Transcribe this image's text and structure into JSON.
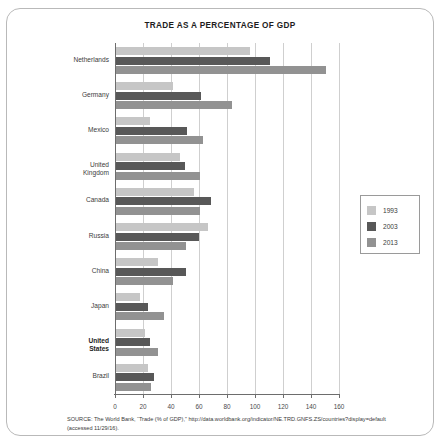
{
  "figure": {
    "title": "TRADE AS A PERCENTAGE OF GDP",
    "source_note": "SOURCE: The World Bank, “Trade (% of GDP),” http://data.worldbank.org/indicator/NE.TRD.GNFS.ZS/countries?display=default (accessed 11/29/16)."
  },
  "legend": {
    "position": "right",
    "items": [
      {
        "label": "1993",
        "color": "#c6c6c6"
      },
      {
        "label": "2003",
        "color": "#585858"
      },
      {
        "label": "2013",
        "color": "#929292"
      }
    ]
  },
  "axis": {
    "x_ticks": [
      "0",
      "20",
      "40",
      "60",
      "80",
      "100",
      "120",
      "140",
      "160"
    ]
  },
  "chart_data": {
    "type": "bar",
    "orientation": "horizontal",
    "title": "TRADE AS A PERCENTAGE OF GDP",
    "xlabel": "",
    "ylabel": "",
    "xlim": [
      0,
      160
    ],
    "xticks": [
      0,
      20,
      40,
      60,
      80,
      100,
      120,
      140,
      160
    ],
    "grid": true,
    "legend_position": "right",
    "categories": [
      "Netherlands",
      "Germany",
      "Mexico",
      "United Kingdom",
      "Canada",
      "Russia",
      "China",
      "Japan",
      "United States",
      "Brazil"
    ],
    "series": [
      {
        "name": "1993",
        "color": "#c6c6c6",
        "values": [
          96,
          41,
          24,
          46,
          56,
          66,
          30,
          17,
          21,
          23
        ]
      },
      {
        "name": "2003",
        "color": "#585858",
        "values": [
          110,
          61,
          51,
          49,
          68,
          59,
          50,
          23,
          24,
          27
        ]
      },
      {
        "name": "2013",
        "color": "#929292",
        "values": [
          150,
          83,
          62,
          60,
          60,
          50,
          41,
          34,
          30,
          25
        ]
      }
    ]
  }
}
